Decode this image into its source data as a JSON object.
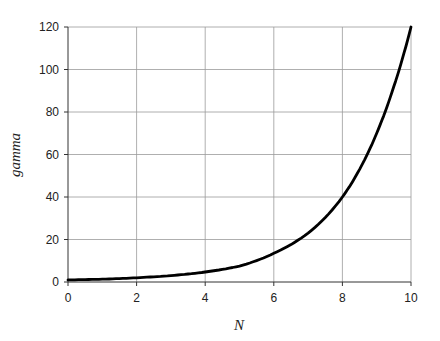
{
  "chart_data": {
    "type": "line",
    "title": "",
    "xlabel": "N",
    "ylabel": "gamma",
    "xlim": [
      0,
      10
    ],
    "ylim": [
      0,
      120
    ],
    "x_ticks": [
      0,
      2,
      4,
      6,
      8,
      10
    ],
    "y_ticks": [
      0,
      20,
      40,
      60,
      80,
      100,
      120
    ],
    "grid": true,
    "legend": null,
    "series": [
      {
        "name": "gamma",
        "color": "#000000",
        "x": [
          0,
          1,
          2,
          3,
          4,
          5,
          6,
          7,
          8,
          8.5,
          9,
          9.5,
          10
        ],
        "values": [
          1,
          1.3,
          2,
          3,
          4.7,
          7.5,
          13.5,
          23,
          40,
          53,
          70,
          92,
          120
        ]
      }
    ]
  }
}
